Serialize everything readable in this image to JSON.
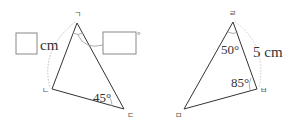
{
  "left_triangle": {
    "vertices": {
      "top": "ㄱ",
      "left": "ㄴ",
      "right": "ㄷ"
    },
    "side_answer_unit": "cm",
    "angle_answer_unit": "°",
    "angle_right": "45°"
  },
  "right_triangle": {
    "vertices": {
      "top": "ㄹ",
      "right": "ㅂ",
      "left": "ㅁ"
    },
    "angle_top": "50°",
    "angle_right": "85°",
    "side_length": "5 cm"
  },
  "colors": {
    "line": "#333333",
    "arc": "#999999",
    "dotted": "#bbbbbb",
    "box": "#888888"
  }
}
